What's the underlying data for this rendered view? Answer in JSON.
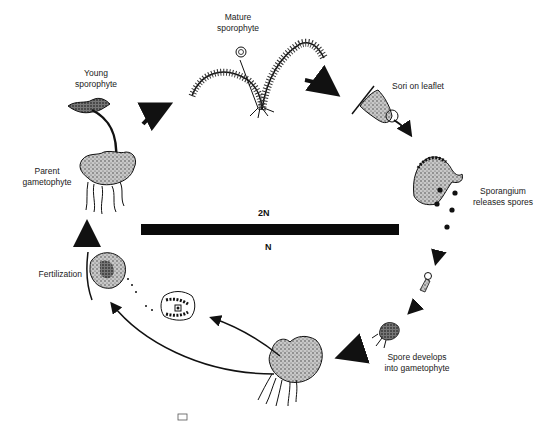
{
  "diagram": {
    "stages": [
      {
        "id": "young-sporophyte",
        "label_line1": "Young",
        "label_line2": "sporophyte"
      },
      {
        "id": "mature-sporophyte",
        "label_line1": "Mature",
        "label_line2": "sporophyte"
      },
      {
        "id": "sori-on-leaflet",
        "label_line1": "Sori on leaflet"
      },
      {
        "id": "sporangium",
        "label_line1": "Sporangium",
        "label_line2": "releases spores"
      },
      {
        "id": "spore-develops",
        "label_line1": "Spore develops",
        "label_line2": "into gametophyte"
      },
      {
        "id": "fertilization",
        "label_line1": "Fertilization"
      },
      {
        "id": "parent-gametophyte",
        "label_line1": "Parent",
        "label_line2": "gametophyte"
      }
    ],
    "ploidy": {
      "diploid": "2N",
      "haploid": "N"
    },
    "colors": {
      "ink": "#111111",
      "background": "#ffffff",
      "stipple": "#9a9a9a"
    }
  }
}
